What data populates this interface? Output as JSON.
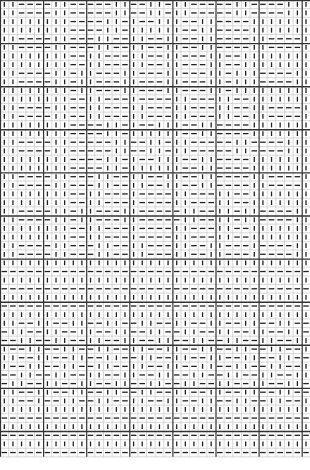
{
  "chart": {
    "legend": {
      "K": "knit (vertical bar)",
      "P": "purl (horizontal dash)"
    },
    "cell_size": 8.62,
    "major_every": 5,
    "columns": 36,
    "colors": {
      "grid_minor": "#c8c8c8",
      "grid_major": "#333333",
      "symbol": "#222222",
      "background": "#ffffff"
    },
    "rows": [
      "KKPPPPKKPPPPPKKPPKKPKKPPPPPKKPPPPKKK",
      "KKPPPPKKPPPPPKKPPKKPKKPPPPPKKPPPPKKK",
      "KKKKKKKKPPPPKKPKPPKKKPPKKPPPPKKKKKKK",
      "KKKKKKKKPPPPKKPKKKKKKPPKKPPPPKKKKKKK",
      "KKPPPPKKPPPKKPPKKPPKKPPKKPPPPKKPPPPK",
      "KKPPPPKKPPPKKPPKKPPKKPPKKPPPPKKPPPPK",
      "KKKKKKKKPPKKPPPKKPPKKPPPKKPPKKKKKKKK",
      "KKKKKKKKPPKKPPPKKPPKKPPPKKPPKKKKKKKK",
      "KKPPPPKKPKKPPPKKPPPKKPPPKKPKKKPPPPKK",
      "KKPPPPKKPKKPPPKKPPPKKPPPKKPKKKPPPPKK",
      "KKKKKKKKPKKPPPKKPPPKKPPPKKPKKKKKKKKK",
      "KKKKKKKKPPKKPPPKPPPPKKPPPKKPPKKKKKKK",
      "KKPPPPKKPPKKPPPKKPPPKKPPPKKPPKKPPPPK",
      "KKPPPPKKPPKKPPPKKPPPKKPPPKKPPKKPPPPK",
      "KKKKKKKKPPPPKKPKPPKKKPPKKPPPPKKKKKKK",
      "KKKKKKKKPPPPKKPKKKKKKPPKKPPPPKKKKKKK",
      "KKPPPPKKPPPPPKKPPKKPKKPPPPPKKPPPPKKK",
      "KKPPPPKKPPPPPKKPPKKPKKPPPPPKKPPPPKKK",
      "KKKKKKKKPPPPKKPKPPKKKPPKKPPPPKKKKKKK",
      "KKKKKKKKPPPPKKPKKKKKKPPKKPPPPKKKKKKK",
      "KKPPPPKKPPPKKPPKKPPKKPPKKPPPPKKPPPPK",
      "KKPPPPKKPPPKKPPKKPPKKPPKKPPPPKKPPPPK",
      "KKKKKKKKPPKKPPPKPPPPKKPPPKKPPKKKKKKK",
      "KKKKKKKKPPKKPPPKPPPPKKPPPKKPPKKKKKKK",
      "KKPPPPKKPKKPPPKKPPPPPKKPPKKPKKPPPPKK",
      "KKPPPPKKPKKPPPKKPPPPPKKPPKKPKKPPPPKK",
      "KKKKKKKKPPKKPPPKPPPPKKPPPKKPPKKKKKKK",
      "KKKKKKKKPPKKPPPKPPPPKKPPPKKPPKKKKKKK",
      "KKPPPPKKPPPKKPPKKPPPKKPPKKPPPKPPPPKK",
      "KKPPPPKKPPPKKPPKKPPPKKPPKKPPPKPPPPKK",
      "KKKKKKKKKKKKKKKKKKKKKKKKKKKKKKKKKKKK",
      "PPPPPPPPPPPPPPPPPPPPPPPPPPPPPPPPPPPP",
      "KKKKKKKKKKKKKKKKKKKKKKKKKKKKKKKKKKKK",
      "PPPPPPPPPPPPPPPPPPPPPPPPPPPPPPPPPPPP",
      "KKKKKKKKKKKKKKKKKKKKKKKKKKKKKKKKKKKK",
      "PPPPPPPPPPPPPPPPPPPPPPPPPPPPPPPPPPPP",
      "KKKKKKKKKKKKKKKKKKKKKKKKKKKKKKKKKKKK",
      "KKPPKKPPKKPPKKPPKKPPKKPPKKPPKKPPKKPP",
      "PKKPPKKPPKKPPKKPPKKPPKKPPKKPPKKPPKKP",
      "PPKKPPKKPPKKPPKKPPKKPPKKPPKKPPKKPPKK",
      "KPPKKPPKKPPKKPPKKPPKKPPKKPPKKPPKKPPK",
      "KKPPKKPPKKPPKKPPKKPPKKPPKKPPKKPPKKPP",
      "KPPKKPPKKPPKKPPKKPPKKPPKKPPKKPPKKPPK",
      "PPKKPPKKPPKKPPKKPPKKPPKKPPKKPPKKPPKK",
      "PKKPPKKPPKKPPKKPPKKPPKKPPKKPPKKPPKKP",
      "KKPPKKPPKKPPKKPPKKPPKKPPKKPPKKPPKKPP",
      "KKPPKPPKKPPKKPPKKPPKKPPKKPPKKPPKKPPK",
      "KKKKKKKKKKKKKKKKKKKKKKKKKKKKKKKKKKKK",
      "PPPPPPPPPPPPPPPPPPPPPPPPPPPPPPPPPPPP",
      "KKKKKKKKKKKKKKKKKKKKKKKKKKKKKKKKKKKK",
      "PPPPPPPPPPPPPPPPPPPPPPPPPPPPPPPPPPPP",
      "KKKKKKKKKKKKKKKKKKKKKKKKKKKKKKKKKKKK",
      "PPPPPPPPPPPPPPPPPPPPPPPPPPPPPPPPPPPP"
    ]
  }
}
